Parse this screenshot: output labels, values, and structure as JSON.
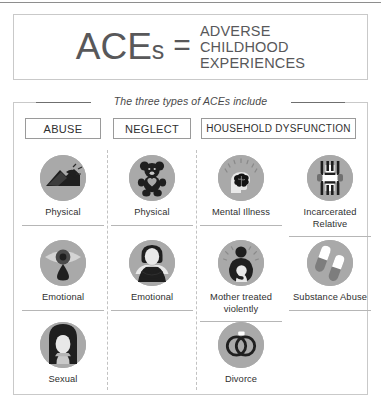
{
  "title": {
    "acronym_main": "ACE",
    "acronym_suffix": "s",
    "equals": "=",
    "expansion_lines": [
      "ADVERSE",
      "CHILDHOOD",
      "EXPERIENCES"
    ]
  },
  "caption": "The three types of ACEs include",
  "columns": [
    {
      "key": "abuse",
      "label": "ABUSE"
    },
    {
      "key": "neglect",
      "label": "NEGLECT"
    },
    {
      "key": "household",
      "label": "HOUSEHOLD DYSFUNCTION"
    }
  ],
  "items": {
    "abuse_physical": {
      "label": "Physical",
      "icon": "fist-icon"
    },
    "abuse_emotional": {
      "label": "Emotional",
      "icon": "crying-eye-icon"
    },
    "abuse_sexual": {
      "label": "Sexual",
      "icon": "distressed-person-icon"
    },
    "neglect_physical": {
      "label": "Physical",
      "icon": "teddy-bear-icon"
    },
    "neglect_emotional": {
      "label": "Emotional",
      "icon": "arms-crossed-person-icon"
    },
    "household_mental_illness": {
      "label": "Mental Illness",
      "icon": "head-brain-icon"
    },
    "household_incarcerated": {
      "label": "Incarcerated Relative",
      "icon": "prison-bars-icon"
    },
    "household_mother_violence": {
      "label": "Mother treated violently",
      "icon": "mother-child-icon"
    },
    "household_substance": {
      "label": "Substance Abuse",
      "icon": "pills-icon"
    },
    "household_divorce": {
      "label": "Divorce",
      "icon": "broken-rings-icon"
    }
  },
  "colors": {
    "icon_circle": "#a9a9a9",
    "icon_dark": "#1f1f1f",
    "text": "#2f2f2f",
    "title_text": "#58585a",
    "border": "#c9c9c9",
    "header_border": "#9a9a9a",
    "divider": "#b6b6b6"
  }
}
